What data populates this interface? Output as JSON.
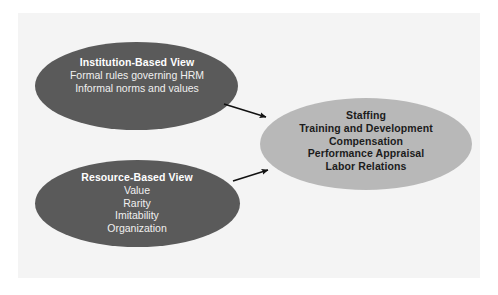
{
  "figure": {
    "background_color": "#ffffff",
    "panel_color": "#f4f4f4",
    "dark_node_color": "#5a5a5a",
    "light_node_color": "#b8b8b8",
    "dark_node_text_color": "#ffffff",
    "light_node_text_color": "#1c1c1c",
    "arrow_color": "#111111"
  },
  "nodes": {
    "institution_based_view": {
      "title": "Institution-Based View",
      "lines": [
        "Formal rules governing HRM",
        "Informal norms and values"
      ]
    },
    "resource_based_view": {
      "title": "Resource-Based View",
      "lines": [
        "Value",
        "Rarity",
        "Imitability",
        "Organization"
      ]
    },
    "hrm_practices": {
      "lines": [
        "Staffing",
        "Training and Development",
        "Compensation",
        "Performance Appraisal",
        "Labor Relations"
      ]
    }
  },
  "arrows": [
    {
      "name": "institution-to-hrm",
      "from": "institution_based_view",
      "to": "hrm_practices"
    },
    {
      "name": "resource-to-hrm",
      "from": "resource_based_view",
      "to": "hrm_practices"
    }
  ]
}
